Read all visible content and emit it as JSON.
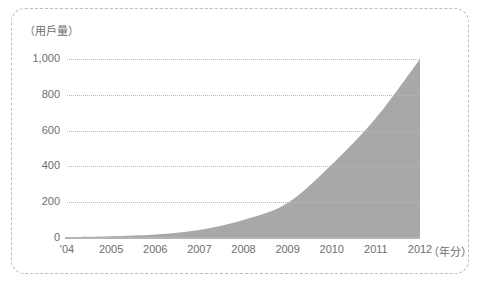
{
  "figure": {
    "y_unit_label": "（用戶量）",
    "x_unit_label": "（年分）",
    "area_color": "#a8a8a8",
    "grid_color": "#b9b9b9",
    "axis_color": "#b4b4b4",
    "text_color": "#6e6e6e",
    "frame_color": "#bdbdbd",
    "background": "#ffffff"
  },
  "chart_data": {
    "type": "area",
    "title": "",
    "subtitle": "",
    "xlabel": "（年分）",
    "ylabel": "（用戶量）",
    "categories": [
      "'04",
      "2005",
      "2006",
      "2007",
      "2008",
      "2009",
      "2010",
      "2011",
      "2012"
    ],
    "x": [
      2004,
      2005,
      2006,
      2007,
      2008,
      2009,
      2010,
      2011,
      2012
    ],
    "values": [
      5,
      10,
      20,
      45,
      100,
      195,
      410,
      670,
      1000
    ],
    "series": [
      {
        "name": "用戶量",
        "values": [
          5,
          10,
          20,
          45,
          100,
          195,
          410,
          670,
          1000
        ]
      }
    ],
    "xtick_labels": [
      "'04",
      "2005",
      "2006",
      "2007",
      "2008",
      "2009",
      "2010",
      "2011",
      "2012"
    ],
    "ytick_labels": [
      "0",
      "200",
      "400",
      "600",
      "800",
      "1,000"
    ],
    "ytick_values": [
      0,
      200,
      400,
      600,
      800,
      1000
    ],
    "ylim": [
      0,
      1000
    ],
    "xlim": [
      2004,
      2012
    ],
    "grid": "horizontal-dotted",
    "legend": "none",
    "annotations": []
  }
}
